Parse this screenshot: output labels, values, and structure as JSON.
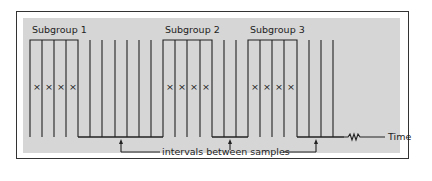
{
  "diagram": {
    "subgroups": [
      {
        "label": "Subgroup 1",
        "x_start": 30,
        "x_end": 78,
        "marks": [
          "×",
          "×",
          "×",
          "×"
        ]
      },
      {
        "label": "Subgroup 2",
        "x_start": 163,
        "x_end": 212,
        "marks": [
          "×",
          "×",
          "×",
          "×"
        ]
      },
      {
        "label": "Subgroup 3",
        "x_start": 248,
        "x_end": 297,
        "marks": [
          "×",
          "×",
          "×",
          "×"
        ]
      }
    ],
    "interval_label": "intervals between samples",
    "axis_label": "Time",
    "colors": {
      "line": "#222222",
      "panel": "#d6d6d6",
      "frame": "#333333"
    }
  }
}
